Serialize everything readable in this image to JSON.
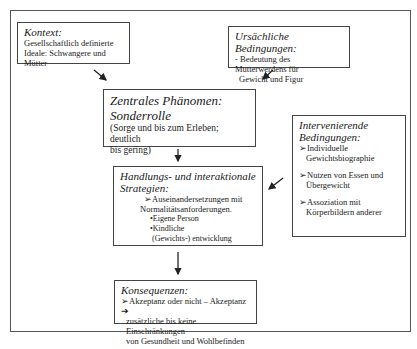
{
  "diagram": {
    "context": {
      "title": "Kontext:",
      "lines": [
        "Gesellschaftlich definierte",
        "Ideale: Schwangere und Mütter"
      ]
    },
    "causal": {
      "title": "Ursächliche Bedingungen:",
      "lines": [
        "- Bedeutung des Mutterwerdens für",
        "Gewicht und Figur"
      ]
    },
    "central": {
      "title1": "Zentrales Phänomen:",
      "title2": "Sonderrolle",
      "lines": [
        "(Sorge und bis zum Erleben; deutlich",
        "bis gering)"
      ]
    },
    "intervening": {
      "title1": "Intervenierende",
      "title2": "Bedingungen:",
      "items": [
        {
          "l1": "➢Individuelle",
          "l2": "Gewichtsbiographie"
        },
        {
          "l1": "➢Nutzen von Essen und",
          "l2": "Übergewicht"
        },
        {
          "l1": "➢Assoziation mit",
          "l2": "Körperbildern anderer"
        }
      ]
    },
    "strategies": {
      "title1": "Handlungs- und interaktionale",
      "title2": "Strategien:",
      "item1": "➢Auseinandersetzungen mit",
      "item1b": "Normalitätsanforderungen.",
      "sub1": "•Eigene Person",
      "sub2": "•Kindliche",
      "sub2b": "(Gewichts-) entwicklung"
    },
    "consequences": {
      "title": "Konsequenzen:",
      "lines": [
        "➢Akzeptanz oder nicht – Akzeptanz ➔",
        "zusätzliche bis keine Einschränkungen",
        "von Gesundheit und Wohlbefinden"
      ]
    }
  }
}
